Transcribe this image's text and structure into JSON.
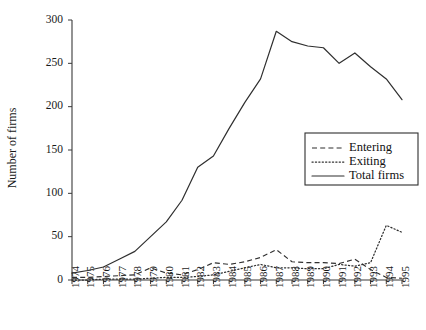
{
  "figure": {
    "background_color": "#ffffff",
    "ink_color": "#2f2f2f",
    "width": 426,
    "height": 330
  },
  "chart_data": {
    "type": "line",
    "title": "",
    "xlabel": "",
    "ylabel": "Number of firms",
    "xlim": [
      1974,
      1995
    ],
    "ylim": [
      0,
      300
    ],
    "yticks": [
      0,
      50,
      100,
      150,
      200,
      250,
      300
    ],
    "grid": false,
    "legend_position": "center-right",
    "x": [
      1974,
      1975,
      1976,
      1977,
      1978,
      1979,
      1980,
      1981,
      1982,
      1983,
      1984,
      1985,
      1986,
      1987,
      1988,
      1989,
      1990,
      1991,
      1992,
      1993,
      1994,
      1995
    ],
    "categories": [
      "1974",
      "1975",
      "1976",
      "1977",
      "1978",
      "1979",
      "1980",
      "1981",
      "1982",
      "1983",
      "1984",
      "1985",
      "1986",
      "1987",
      "1988",
      "1989",
      "1990",
      "1991",
      "1992",
      "1993",
      "1994",
      "1995"
    ],
    "series": [
      {
        "name": "Entering",
        "style": "dashed",
        "color": "#2f2f2f",
        "values": [
          3,
          3,
          4,
          5,
          6,
          14,
          8,
          6,
          12,
          20,
          18,
          21,
          26,
          35,
          21,
          20,
          20,
          19,
          24,
          12,
          3,
          2
        ]
      },
      {
        "name": "Exiting",
        "style": "dotted",
        "color": "#2f2f2f",
        "values": [
          0,
          0,
          1,
          1,
          1,
          2,
          3,
          3,
          4,
          6,
          10,
          14,
          18,
          14,
          14,
          13,
          13,
          18,
          16,
          20,
          63,
          55
        ]
      },
      {
        "name": "Total firms",
        "style": "solid",
        "color": "#2f2f2f",
        "values": [
          8,
          11,
          15,
          24,
          33,
          50,
          67,
          92,
          130,
          143,
          175,
          205,
          232,
          287,
          275,
          270,
          268,
          250,
          262,
          246,
          232,
          208
        ]
      }
    ]
  },
  "legend": {
    "items": [
      {
        "label": "Entering",
        "style": "dashed"
      },
      {
        "label": "Exiting",
        "style": "dotted"
      },
      {
        "label": "Total firms",
        "style": "solid"
      }
    ]
  }
}
